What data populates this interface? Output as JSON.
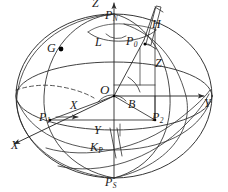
{
  "figure": {
    "type": "geometric-diagram",
    "canvas": {
      "width": 228,
      "height": 192
    },
    "stroke_color": "#2b2b2b",
    "background_color": "#ffffff",
    "point_marker_color": "#000000"
  },
  "axes": [
    {
      "name": "z-axis",
      "label": "Z",
      "direction": "up",
      "arrow": true
    },
    {
      "name": "y-axis",
      "label": "Y",
      "direction": "right",
      "arrow": true
    },
    {
      "name": "x-axis",
      "label": "X",
      "direction": "lower-left",
      "arrow": true
    }
  ],
  "labels": {
    "z_axis": "Z",
    "y_axis": "Y",
    "x_axis_outer": "X",
    "x_axis_inner": "X",
    "y_axis_inner": "Y",
    "origin": "O",
    "north_pole": {
      "base": "P",
      "sub": "N"
    },
    "south_pole": {
      "base": "P",
      "sub": "S"
    },
    "point_g": "G",
    "point_p0": {
      "base": "P",
      "sub": "0"
    },
    "point_p1": {
      "base": "P",
      "sub": "1"
    },
    "point_p2": {
      "base": "P",
      "sub": "2"
    },
    "point_kp": {
      "base": "K",
      "sub": "P"
    },
    "angle_longitude": "L",
    "angle_latitude": "B",
    "height": "H",
    "zenith": "Z"
  },
  "annotations": [
    {
      "name": "longitude-angle",
      "symbol": "L",
      "note": "angle at north pole between meridians"
    },
    {
      "name": "latitude-angle",
      "symbol": "B",
      "note": "angle at origin above equatorial plane"
    },
    {
      "name": "ellipsoidal-height",
      "symbol": "H",
      "note": "normal height above surface"
    },
    {
      "name": "zenith-direction",
      "symbol": "Z",
      "note": "normal direction line"
    },
    {
      "name": "surface-point",
      "symbol": "P0",
      "note": "point on ellipsoid surface"
    },
    {
      "name": "greenwich-point",
      "symbol": "G",
      "note": "marked point with filled dot"
    }
  ]
}
